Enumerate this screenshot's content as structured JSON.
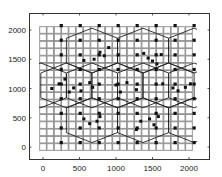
{
  "chart_data": {
    "type": "scatter",
    "title": "",
    "xlabel": "",
    "ylabel": "",
    "xlim": [
      -200,
      2250
    ],
    "ylim": [
      -200,
      2250
    ],
    "x_ticks": [
      0,
      500,
      1000,
      1500,
      2000
    ],
    "y_ticks": [
      0,
      500,
      1000,
      1500,
      2000
    ],
    "x_tick_labels": [
      "0",
      "500",
      "1000",
      "1500",
      "2000"
    ],
    "y_tick_labels": [
      "0",
      "500",
      "1000",
      "1500",
      "2000"
    ],
    "grid": false,
    "legend": null,
    "box": true,
    "series": [
      {
        "name": "grid-squares",
        "marker": "square-open",
        "color": "#8a8a8a",
        "x_start": 0,
        "x_step": 100,
        "x_count": 21,
        "y_start": 0,
        "y_step": 125,
        "y_count": 17
      },
      {
        "name": "regular-dots",
        "marker": "filled-square",
        "color": "#111111",
        "x_start": 250,
        "x_step": 260,
        "x_count": 8,
        "y_start": 2075,
        "y_step": -250,
        "y_count": 9
      },
      {
        "name": "cluster-dots",
        "marker": "filled-square",
        "color": "#111111",
        "points": [
          [
            780,
            1620
          ],
          [
            840,
            1560
          ],
          [
            700,
            1500
          ],
          [
            560,
            1480
          ],
          [
            900,
            1700
          ],
          [
            1440,
            1520
          ],
          [
            1500,
            1470
          ],
          [
            1560,
            1420
          ],
          [
            1620,
            1580
          ],
          [
            1380,
            1600
          ],
          [
            300,
            1160
          ],
          [
            220,
            1080
          ],
          [
            120,
            1000
          ],
          [
            420,
            1010
          ],
          [
            520,
            960
          ],
          [
            360,
            940
          ],
          [
            640,
            1100
          ],
          [
            680,
            1020
          ],
          [
            1000,
            1060
          ],
          [
            1060,
            940
          ],
          [
            1150,
            1100
          ],
          [
            1280,
            980
          ],
          [
            1640,
            1080
          ],
          [
            1780,
            1010
          ],
          [
            1850,
            960
          ],
          [
            1950,
            1020
          ],
          [
            2020,
            1080
          ],
          [
            740,
            440
          ],
          [
            780,
            520
          ],
          [
            640,
            400
          ],
          [
            560,
            480
          ],
          [
            1340,
            440
          ],
          [
            1460,
            480
          ],
          [
            1520,
            380
          ],
          [
            1580,
            520
          ],
          [
            1280,
            300
          ]
        ]
      },
      {
        "name": "hexagon-cells",
        "type": "polygon-outline",
        "color": "#222222",
        "width": 700,
        "shoulder": 170,
        "side": 425,
        "centers": [
          [
            670,
            1648
          ],
          [
            1370,
            1648
          ],
          [
            2070,
            1648
          ],
          [
            -30,
            1053
          ],
          [
            670,
            1053
          ],
          [
            1370,
            1053
          ],
          [
            2070,
            1053
          ],
          [
            320,
            1053
          ],
          [
            1020,
            1053
          ],
          [
            1720,
            1053
          ],
          [
            670,
            458
          ],
          [
            1370,
            458
          ],
          [
            2070,
            458
          ]
        ]
      }
    ]
  }
}
